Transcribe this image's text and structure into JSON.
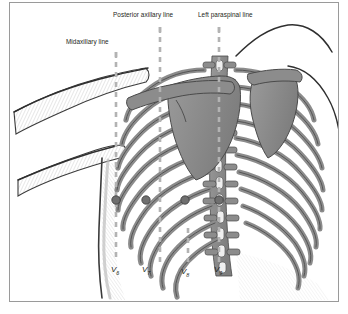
{
  "figure": {
    "title_alt": "Posterior chest wall electrode positions V6-V9",
    "background": "#ffffff",
    "frame_color": "#9a9a9a",
    "bone_fill": "#8c8c8c",
    "bone_stroke": "#4a4a4a",
    "electrode_color": "#6f6f6f",
    "dashed_line_color": "#b3b3b3",
    "skin_stroke": "#3b3b3b"
  },
  "reference_lines": [
    {
      "id": "midaxillary",
      "label": "Midaxillary line",
      "x": 116,
      "label_x": 66,
      "label_y": 41,
      "top": 52,
      "bottom": 262
    },
    {
      "id": "posterior-axillary",
      "label": "Posterior axillary line",
      "x": 160,
      "label_x": 113,
      "label_y": 16,
      "top": 27,
      "bottom": 262
    },
    {
      "id": "left-paraspinal",
      "label": "Left paraspinal line",
      "x": 219,
      "label_x": 199,
      "label_y": 16,
      "top": 27,
      "bottom": 262
    },
    {
      "id": "scapular",
      "label": "",
      "x": 188,
      "label_x": 0,
      "label_y": 0,
      "top": 228,
      "bottom": 262
    }
  ],
  "electrodes": [
    {
      "id": "v6",
      "label": "V",
      "sub": "6",
      "x": 116,
      "y": 200,
      "label_x": 112,
      "label_y": 268,
      "r": 4.2
    },
    {
      "id": "v7",
      "label": "V",
      "sub": "7",
      "x": 146,
      "y": 200,
      "label_x": 143,
      "label_y": 268,
      "r": 4.2
    },
    {
      "id": "v8",
      "label": "V",
      "sub": "8",
      "x": 185,
      "y": 200,
      "label_x": 182,
      "label_y": 270,
      "r": 4.2
    },
    {
      "id": "v9",
      "label": "V",
      "sub": "9",
      "x": 219,
      "y": 200,
      "label_x": 215,
      "label_y": 268,
      "r": 4.2
    }
  ]
}
